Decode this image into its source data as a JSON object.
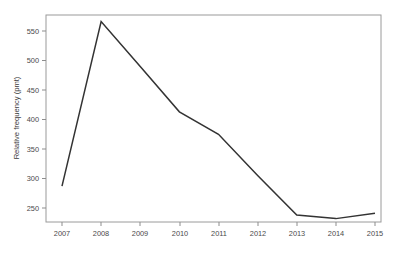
{
  "chart_data": {
    "type": "line",
    "title": "",
    "xlabel": "",
    "ylabel": "Relative frequency (pmt)",
    "x": [
      2007,
      2008,
      2009,
      2010,
      2011,
      2012,
      2013,
      2014,
      2015
    ],
    "categories": [
      "2007",
      "2008",
      "2009",
      "2010",
      "2011",
      "2012",
      "2013",
      "2014",
      "2015"
    ],
    "values": [
      287,
      566,
      490,
      413,
      375,
      305,
      238,
      232,
      241
    ],
    "series": [
      {
        "name": "Relative frequency (pmt)",
        "values": [
          287,
          566,
          490,
          413,
          375,
          305,
          238,
          232,
          241
        ]
      }
    ],
    "xlim": [
      2006.6,
      2015.6
    ],
    "ylim": [
      222,
      582
    ],
    "ytick_labels": [
      "250",
      "300",
      "350",
      "400",
      "450",
      "500",
      "550"
    ],
    "yticks": [
      250,
      300,
      350,
      400,
      450,
      500,
      550
    ],
    "xtick_labels": [
      "2007",
      "2008",
      "2009",
      "2010",
      "2011",
      "2012",
      "2013",
      "2014",
      "2015"
    ],
    "xticks": [
      2007,
      2008,
      2009,
      2010,
      2011,
      2012,
      2013,
      2014,
      2015
    ],
    "grid": false,
    "legend": "none",
    "line_color": "#333333",
    "frame_color": "#9a9a9a",
    "background_color": "#ffffff"
  }
}
